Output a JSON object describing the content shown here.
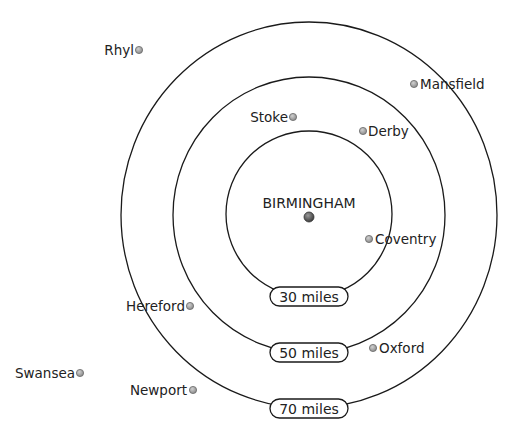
{
  "diagram": {
    "center": {
      "name": "BIRMINGHAM",
      "x": 309,
      "y": 217
    },
    "rings": [
      {
        "label": "30 miles",
        "radius": 84
      },
      {
        "label": "50 miles",
        "radius": 137
      },
      {
        "label": "70 miles",
        "radius": 191
      }
    ],
    "towns": [
      {
        "name": "Rhyl",
        "dot_x": 138,
        "dot_y": 50,
        "label_side": "left"
      },
      {
        "name": "Mansfield",
        "dot_x": 414,
        "dot_y": 84,
        "label_side": "right"
      },
      {
        "name": "Stoke",
        "dot_x": 293,
        "dot_y": 117,
        "label_side": "left"
      },
      {
        "name": "Derby",
        "dot_x": 363,
        "dot_y": 131,
        "label_side": "right"
      },
      {
        "name": "Coventry",
        "dot_x": 369,
        "dot_y": 239,
        "label_side": "right"
      },
      {
        "name": "Hereford",
        "dot_x": 190,
        "dot_y": 306,
        "label_side": "left"
      },
      {
        "name": "Oxford",
        "dot_x": 373,
        "dot_y": 348,
        "label_side": "right"
      },
      {
        "name": "Swansea",
        "dot_x": 80,
        "dot_y": 373,
        "label_side": "left"
      },
      {
        "name": "Newport",
        "dot_x": 193,
        "dot_y": 390,
        "label_side": "left"
      }
    ],
    "colors": {
      "line": "#1a1a1a",
      "town_dot": "#9a9a9a",
      "center_dot": "#555555"
    }
  }
}
